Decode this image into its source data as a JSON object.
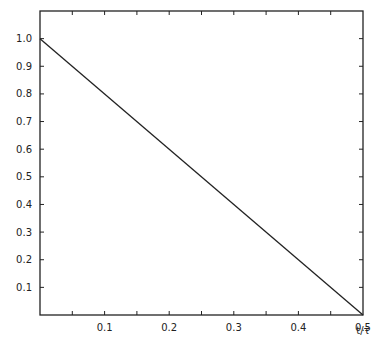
{
  "chart_data": {
    "type": "line",
    "title": "",
    "xlabel": "t/τ",
    "ylabel": "",
    "xlim": [
      0,
      0.5
    ],
    "ylim": [
      0,
      1.1
    ],
    "grid": false,
    "legend": null,
    "x_ticks": [
      "0.1",
      "0.2",
      "0.3",
      "0.4",
      "0.5"
    ],
    "y_ticks": [
      "0.1",
      "0.2",
      "0.3",
      "0.4",
      "0.5",
      "0.6",
      "0.7",
      "0.8",
      "0.9",
      "1.0"
    ],
    "series": [
      {
        "name": "line",
        "x": [
          0,
          0.5
        ],
        "y": [
          1.0,
          0.0
        ]
      }
    ]
  }
}
